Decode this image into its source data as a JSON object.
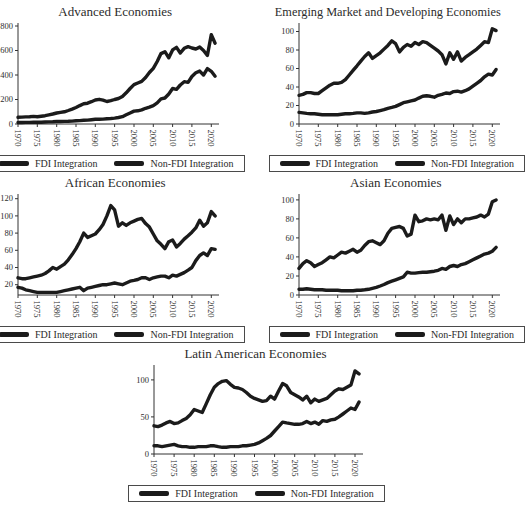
{
  "figure": {
    "background": "#ffffff",
    "line_color": "#1b1b1b",
    "axis_color": "#333333",
    "text_color": "#2e2e2e"
  },
  "legend": {
    "items": [
      {
        "label": "FDI Integration"
      },
      {
        "label": "Non-FDI Integration"
      }
    ]
  },
  "chart_data": [
    {
      "type": "line",
      "title": "Advanced Economies",
      "xlabel": "",
      "ylabel": "",
      "grid": false,
      "legend_position": "bottom",
      "x_start": 1970,
      "x_end": 2021,
      "x_step": 1,
      "xlim": [
        1970,
        2022
      ],
      "ylim": [
        0,
        800
      ],
      "x_ticks": [
        1970,
        1975,
        1980,
        1985,
        1990,
        1995,
        2000,
        2005,
        2010,
        2015,
        2020
      ],
      "y_ticks": [
        0,
        200,
        400,
        600,
        800
      ],
      "series": [
        {
          "name": "FDI Integration",
          "values": [
            12,
            12,
            13,
            13,
            14,
            15,
            15,
            16,
            17,
            18,
            20,
            20,
            21,
            22,
            24,
            26,
            28,
            30,
            32,
            35,
            38,
            39,
            40,
            43,
            45,
            48,
            53,
            60,
            75,
            90,
            105,
            108,
            115,
            128,
            138,
            150,
            172,
            205,
            212,
            245,
            290,
            283,
            318,
            345,
            340,
            388,
            418,
            432,
            400,
            452,
            430,
            390
          ]
        },
        {
          "name": "Non-FDI Integration",
          "values": [
            55,
            56,
            58,
            60,
            62,
            60,
            64,
            68,
            74,
            82,
            90,
            95,
            100,
            110,
            122,
            135,
            150,
            165,
            170,
            182,
            196,
            202,
            195,
            184,
            190,
            200,
            208,
            225,
            255,
            290,
            322,
            335,
            348,
            380,
            420,
            455,
            510,
            575,
            590,
            540,
            605,
            625,
            580,
            618,
            632,
            620,
            612,
            628,
            600,
            560,
            730,
            660
          ]
        }
      ]
    },
    {
      "type": "line",
      "title": "Emerging Market and Developing Economies",
      "xlabel": "",
      "ylabel": "",
      "grid": false,
      "legend_position": "bottom",
      "x_start": 1970,
      "x_end": 2021,
      "x_step": 1,
      "xlim": [
        1970,
        2022
      ],
      "ylim": [
        0,
        106
      ],
      "x_ticks": [
        1970,
        1975,
        1980,
        1985,
        1990,
        1995,
        2000,
        2005,
        2010,
        2015,
        2020
      ],
      "y_ticks": [
        0,
        20,
        40,
        60,
        80,
        100
      ],
      "series": [
        {
          "name": "FDI Integration",
          "values": [
            12.5,
            12,
            11.5,
            11,
            11,
            10.5,
            10,
            10,
            10,
            10,
            10,
            10.5,
            11,
            11,
            11.5,
            12,
            12,
            11.5,
            12,
            13,
            13.5,
            14.5,
            15.5,
            17,
            18,
            19,
            21,
            23,
            24,
            25,
            26,
            28,
            30,
            30.5,
            30,
            29,
            31,
            32,
            33.5,
            33,
            35,
            35.5,
            34.5,
            36,
            38,
            41,
            44,
            47,
            51,
            54,
            53,
            59
          ]
        },
        {
          "name": "Non-FDI Integration",
          "values": [
            31,
            32,
            34,
            34,
            33,
            33,
            36,
            39,
            42,
            44,
            44,
            45,
            48,
            53,
            58,
            63,
            68,
            73,
            77,
            71,
            74,
            77,
            81,
            85,
            90,
            87,
            78,
            83,
            86,
            84,
            88,
            86,
            89,
            88,
            85,
            82,
            79,
            75,
            65,
            77,
            70,
            78,
            68,
            72,
            75,
            78,
            81,
            85,
            89,
            88,
            103,
            101
          ]
        }
      ]
    },
    {
      "type": "line",
      "title": "African Economies",
      "xlabel": "",
      "ylabel": "",
      "grid": false,
      "legend_position": "bottom",
      "x_start": 1970,
      "x_end": 2021,
      "x_step": 1,
      "xlim": [
        1970,
        2022
      ],
      "ylim": [
        8,
        122
      ],
      "x_ticks": [
        1970,
        1975,
        1980,
        1985,
        1990,
        1995,
        2000,
        2005,
        2010,
        2015,
        2020
      ],
      "y_ticks": [
        20,
        40,
        60,
        80,
        100,
        120
      ],
      "series": [
        {
          "name": "FDI Integration",
          "values": [
            17,
            16,
            14,
            13,
            12,
            11,
            11,
            11,
            11,
            11,
            11,
            12,
            13,
            14,
            15,
            16,
            17,
            13,
            16,
            17,
            18,
            19,
            20,
            20,
            21,
            22,
            21,
            20,
            22,
            24,
            25,
            26,
            28,
            28,
            26,
            28,
            29,
            30,
            30,
            28,
            31,
            30,
            32,
            34,
            37,
            40,
            48,
            54,
            57,
            54,
            62,
            61
          ]
        },
        {
          "name": "Non-FDI Integration",
          "values": [
            28,
            27,
            27,
            28,
            29,
            30,
            31,
            33,
            36,
            40,
            38,
            41,
            44,
            49,
            55,
            62,
            70,
            80,
            75,
            77,
            79,
            84,
            90,
            100,
            112,
            107,
            88,
            92,
            89,
            92,
            94,
            96,
            97,
            91,
            87,
            79,
            71,
            67,
            62,
            70,
            72,
            64,
            68,
            73,
            77,
            81,
            86,
            95,
            88,
            92,
            105,
            100
          ]
        }
      ]
    },
    {
      "type": "line",
      "title": "Asian Economies",
      "xlabel": "",
      "ylabel": "",
      "grid": false,
      "legend_position": "bottom",
      "x_start": 1970,
      "x_end": 2021,
      "x_step": 1,
      "xlim": [
        1970,
        2022
      ],
      "ylim": [
        0,
        103
      ],
      "x_ticks": [
        1970,
        1975,
        1980,
        1985,
        1990,
        1995,
        2000,
        2005,
        2010,
        2015,
        2020
      ],
      "y_ticks": [
        0,
        20,
        40,
        60,
        80,
        100
      ],
      "series": [
        {
          "name": "FDI Integration",
          "values": [
            6,
            6,
            6.5,
            6,
            5.5,
            5.5,
            5.5,
            5,
            5,
            5,
            5,
            4.5,
            4.5,
            4.5,
            4.5,
            5,
            5,
            5.5,
            6,
            7,
            8,
            9.5,
            11,
            13,
            14.5,
            16,
            17.5,
            19,
            24,
            23,
            23,
            23.5,
            24,
            24,
            24.5,
            25,
            26,
            28,
            27,
            30,
            31,
            30,
            32,
            33,
            35,
            37,
            39,
            41,
            43,
            44,
            46,
            50
          ]
        },
        {
          "name": "Non-FDI Integration",
          "values": [
            28,
            33,
            36,
            34,
            30,
            32,
            34,
            37,
            40,
            39,
            42,
            45,
            44,
            46,
            48,
            45,
            47,
            52,
            56,
            57,
            55,
            53,
            57,
            65,
            70,
            71,
            72,
            70,
            62,
            64,
            84,
            77,
            78,
            80,
            79,
            80,
            79,
            84,
            68,
            83,
            74,
            80,
            76,
            80,
            80,
            81,
            82,
            84,
            82,
            85,
            98,
            100
          ]
        }
      ]
    },
    {
      "type": "line",
      "title": "Latin American Economies",
      "xlabel": "",
      "ylabel": "",
      "grid": false,
      "legend_position": "bottom",
      "x_start": 1970,
      "x_end": 2021,
      "x_step": 1,
      "xlim": [
        1970,
        2022
      ],
      "ylim": [
        0,
        116
      ],
      "x_ticks": [
        1970,
        1975,
        1980,
        1985,
        1990,
        1995,
        2000,
        2005,
        2010,
        2015,
        2020
      ],
      "y_ticks": [
        0,
        50,
        100
      ],
      "series": [
        {
          "name": "FDI Integration",
          "values": [
            11,
            11,
            10,
            11,
            12,
            13,
            11,
            10,
            10,
            9,
            9,
            10,
            10,
            10,
            11,
            11,
            10,
            9,
            9,
            10,
            10,
            10,
            11,
            11,
            12,
            13,
            15,
            18,
            21,
            25,
            31,
            37,
            43,
            42,
            41,
            40,
            40,
            41,
            44,
            41,
            43,
            40,
            45,
            44,
            46,
            47,
            50,
            54,
            58,
            62,
            60,
            70
          ]
        },
        {
          "name": "Non-FDI Integration",
          "values": [
            38,
            37,
            39,
            42,
            44,
            41,
            42,
            45,
            48,
            53,
            60,
            58,
            56,
            68,
            80,
            90,
            95,
            98,
            99,
            94,
            90,
            89,
            87,
            83,
            78,
            75,
            73,
            71,
            72,
            78,
            74,
            85,
            95,
            92,
            83,
            80,
            77,
            73,
            78,
            69,
            74,
            71,
            73,
            75,
            80,
            85,
            88,
            87,
            90,
            93,
            112,
            108
          ]
        }
      ]
    }
  ]
}
